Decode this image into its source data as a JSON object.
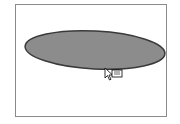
{
  "canvas": {
    "background": "#ffffff",
    "border_color": "#8a8a8a"
  },
  "shape": {
    "type": "ellipse",
    "fill": "#8c8c8c",
    "stroke": "#3a3a3a",
    "cx": 95,
    "cy": 50,
    "rx": 70,
    "ry": 19,
    "rotation_deg": 3
  },
  "cursor": {
    "type": "move-copy-arrow",
    "x": 104,
    "y": 67
  }
}
